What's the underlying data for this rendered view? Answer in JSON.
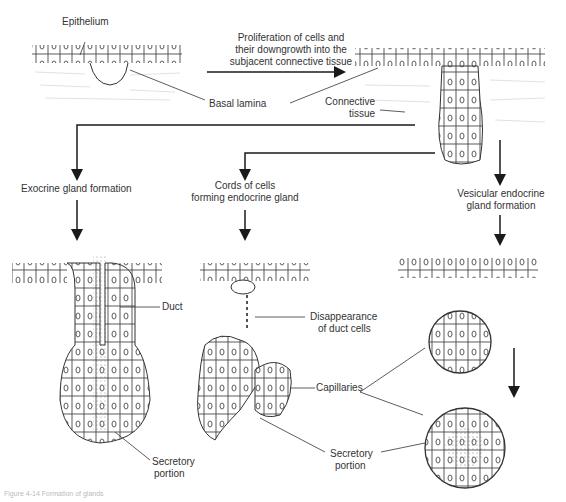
{
  "diagram": {
    "labels": {
      "epithelium": "Epithelium",
      "proliferation_line1": "Proliferation of cells and",
      "proliferation_line2": "their downgrowth into the",
      "proliferation_line3": "subjacent connective tissue",
      "basal_lamina": "Basal lamina",
      "connective_line1": "Connective",
      "connective_line2": "tissue",
      "exocrine": "Exocrine gland formation",
      "cords_line1": "Cords of cells",
      "cords_line2": "forming endocrine gland",
      "vesicular_line1": "Vesicular endocrine",
      "vesicular_line2": "gland formation",
      "duct": "Duct",
      "disappearance_line1": "Disappearance",
      "disappearance_line2": "of duct cells",
      "capillaries": "Capillaries",
      "secretory1_line1": "Secretory",
      "secretory1_line2": "portion",
      "secretory2_line1": "Secretory",
      "secretory2_line2": "portion"
    },
    "caption": "Figure 4-14 Formation of glands",
    "colors": {
      "ink": "#1a1a1a",
      "text": "#333333",
      "tissue": "#bbbbbb",
      "background": "#ffffff"
    }
  }
}
